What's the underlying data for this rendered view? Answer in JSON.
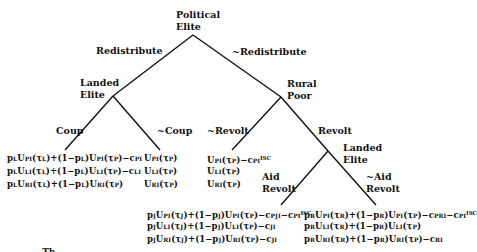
{
  "figure": {
    "type": "game-tree",
    "line_color": "#111111"
  },
  "nodes": {
    "root": {
      "label_line1": "Political",
      "label_line2": "Elite"
    },
    "landed_elite_1": {
      "label_line1": "Landed",
      "label_line2": "Elite"
    },
    "rural_poor": {
      "label_line1": "Rural",
      "label_line2": "Poor"
    },
    "landed_elite_2": {
      "label_line1": "Landed",
      "label_line2": "Elite"
    }
  },
  "edges": {
    "redistribute": "Redistribute",
    "not_redistribute": "~Redistribute",
    "coup": "Coup",
    "not_coup": "~Coup",
    "not_revolt": "~Revolt",
    "revolt": "Revolt",
    "aid_revolt_line1": "Aid",
    "aid_revolt_line2": "Revolt",
    "not_aid_revolt_line1": "~Aid",
    "not_aid_revolt_line2": "Revolt"
  },
  "payoffs": {
    "coup": [
      "pLUPI(τL)+(1−pL)UPI(τP)−cPI",
      "pLULI(τL)+(1−pL)ULI(τP)−cLI",
      "pLURI(τL)+(1−pL)URI(τP)"
    ],
    "not_coup": [
      "UPI(τP)",
      "ULI(τP)",
      "URI(τP)"
    ],
    "not_revolt": [
      "UPI(τP)−cPI^ISC",
      "ULI(τP)",
      "URI(τP)"
    ],
    "aid_revolt": [
      "pJUPI(τJ)+(1−pJ)UPI(τP)−cPJI−cPI^ISC",
      "pJULI(τJ)+(1−pJ)ULI(τP)−cJI",
      "pJURI(τJ)+(1−pJ)URI(τP)−cJI"
    ],
    "not_aid_revolt": [
      "pRUPI(τR)+(1−pR)UPI(τP)−cPRI−cPI^ISC",
      "pRULI(τR)+(1−pR)ULI(τP)",
      "pRURI(τR)+(1−pR)URI(τP)−cRI"
    ]
  },
  "caption_fragment": "… Th…"
}
